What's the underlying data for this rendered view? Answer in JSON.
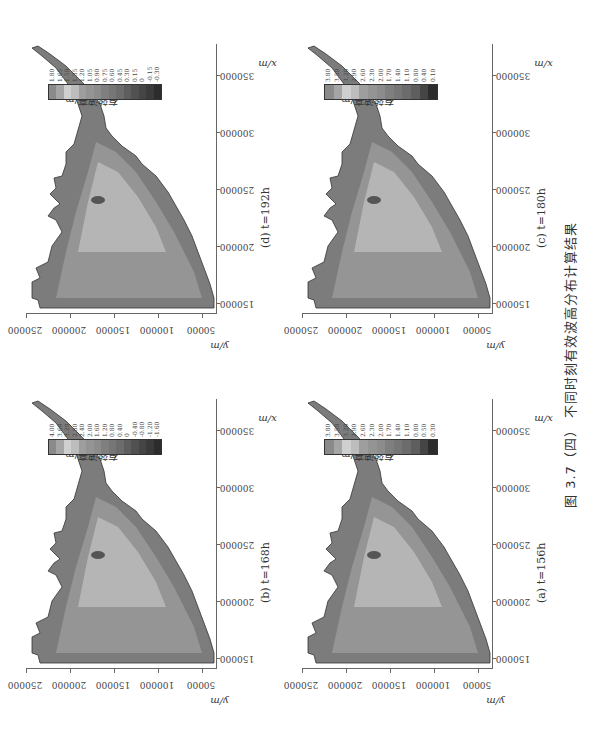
{
  "figure": {
    "caption": "图 3.7（四）   不同时刻有效波高分布计算结果",
    "orientation": "rotated 90° counter-clockwise on page"
  },
  "panels": [
    {
      "id": "b",
      "label": "(b)  t=168h",
      "legend_title": "有效波高/m",
      "legend_values": [
        "4.00",
        "3.60",
        "3.20",
        "2.80",
        "2.40",
        "2.00",
        "1.60",
        "1.20",
        "0.80",
        "0.40",
        "0",
        "-0.40",
        "-0.80",
        "-1.20",
        "-1.60"
      ],
      "legend_colors": [
        "#8a8a8a",
        "#a5a5a5",
        "#cfcfcf",
        "#bdbdbd",
        "#9e9e9e",
        "#949494",
        "#8c8c8c",
        "#7f7f7f",
        "#767676",
        "#6c6c6c",
        "#5e5e5e",
        "#515151",
        "#454545",
        "#3a3a3a",
        "#2c2c2c"
      ]
    },
    {
      "id": "d",
      "label": "(d)  t=192h",
      "legend_title": "有效波高/m",
      "legend_values": [
        "1.80",
        "1.65",
        "1.50",
        "1.35",
        "1.20",
        "1.05",
        "0.90",
        "0.75",
        "0.60",
        "0.45",
        "0.30",
        "0.15",
        "0",
        "-0.15",
        "-0.30"
      ],
      "legend_colors": [
        "#8a8a8a",
        "#a5a5a5",
        "#cfcfcf",
        "#bdbdbd",
        "#9e9e9e",
        "#949494",
        "#8c8c8c",
        "#7f7f7f",
        "#767676",
        "#6c6c6c",
        "#5e5e5e",
        "#515151",
        "#454545",
        "#3a3a3a",
        "#2c2c2c"
      ]
    },
    {
      "id": "a",
      "label": "(a)  t=156h",
      "legend_title": "有效波高/m",
      "legend_values": [
        "3.80",
        "3.50",
        "3.20",
        "2.90",
        "2.60",
        "2.30",
        "2.00",
        "1.70",
        "1.40",
        "1.10",
        "0.80",
        "0.50",
        "0.30"
      ],
      "legend_colors": [
        "#8a8a8a",
        "#a5a5a5",
        "#cfcfcf",
        "#bdbdbd",
        "#9e9e9e",
        "#949494",
        "#8c8c8c",
        "#7f7f7f",
        "#767676",
        "#6c6c6c",
        "#5e5e5e",
        "#454545",
        "#2c2c2c"
      ]
    },
    {
      "id": "c",
      "label": "(c)  t=180h",
      "legend_title": "有效波高/m",
      "legend_values": [
        "3.80",
        "3.50",
        "3.20",
        "2.90",
        "2.60",
        "2.30",
        "2.00",
        "1.70",
        "1.40",
        "1.10",
        "0.80",
        "0.40",
        "0.10"
      ],
      "legend_colors": [
        "#8a8a8a",
        "#a5a5a5",
        "#cfcfcf",
        "#bdbdbd",
        "#9e9e9e",
        "#949494",
        "#8c8c8c",
        "#7f7f7f",
        "#767676",
        "#6c6c6c",
        "#5e5e5e",
        "#454545",
        "#2c2c2c"
      ]
    }
  ],
  "axes": {
    "xlabel": "x/m",
    "ylabel": "y/m",
    "xticks": [
      "150000",
      "200000",
      "250000",
      "300000",
      "350000"
    ],
    "yticks": [
      "250000",
      "200000",
      "150000",
      "100000",
      "50000"
    ]
  },
  "chart_data": [
    {
      "type": "heatmap",
      "title": "(b) t=168h",
      "xlabel": "x/m",
      "ylabel": "y/m",
      "xlim": [
        140000,
        375000
      ],
      "ylim": [
        40000,
        250000
      ],
      "xticks": [
        150000,
        200000,
        250000,
        300000,
        350000
      ],
      "yticks": [
        50000,
        100000,
        150000,
        200000,
        250000
      ],
      "colorbar_label": "有效波高/m",
      "colorbar_levels": [
        4.0,
        3.6,
        3.2,
        2.8,
        2.4,
        2.0,
        1.6,
        1.2,
        0.8,
        0.4,
        0,
        -0.4,
        -0.8,
        -1.2,
        -1.6
      ]
    },
    {
      "type": "heatmap",
      "title": "(d) t=192h",
      "xlabel": "x/m",
      "ylabel": "y/m",
      "xlim": [
        140000,
        375000
      ],
      "ylim": [
        40000,
        250000
      ],
      "xticks": [
        150000,
        200000,
        250000,
        300000,
        350000
      ],
      "yticks": [
        50000,
        100000,
        150000,
        200000,
        250000
      ],
      "colorbar_label": "有效波高/m",
      "colorbar_levels": [
        1.8,
        1.65,
        1.5,
        1.35,
        1.2,
        1.05,
        0.9,
        0.75,
        0.6,
        0.45,
        0.3,
        0.15,
        0,
        -0.15,
        -0.3
      ]
    },
    {
      "type": "heatmap",
      "title": "(a) t=156h",
      "xlabel": "x/m",
      "ylabel": "y/m",
      "xlim": [
        140000,
        375000
      ],
      "ylim": [
        40000,
        250000
      ],
      "xticks": [
        150000,
        200000,
        250000,
        300000,
        350000
      ],
      "yticks": [
        50000,
        100000,
        150000,
        200000,
        250000
      ],
      "colorbar_label": "有效波高/m",
      "colorbar_levels": [
        3.8,
        3.5,
        3.2,
        2.9,
        2.6,
        2.3,
        2.0,
        1.7,
        1.4,
        1.1,
        0.8,
        0.5,
        0.3
      ]
    },
    {
      "type": "heatmap",
      "title": "(c) t=180h",
      "xlabel": "x/m",
      "ylabel": "y/m",
      "xlim": [
        140000,
        375000
      ],
      "ylim": [
        40000,
        250000
      ],
      "xticks": [
        150000,
        200000,
        250000,
        300000,
        350000
      ],
      "yticks": [
        50000,
        100000,
        150000,
        200000,
        250000
      ],
      "colorbar_label": "有效波高/m",
      "colorbar_levels": [
        3.8,
        3.5,
        3.2,
        2.9,
        2.6,
        2.3,
        2.0,
        1.7,
        1.4,
        1.1,
        0.8,
        0.4,
        0.1
      ]
    }
  ]
}
